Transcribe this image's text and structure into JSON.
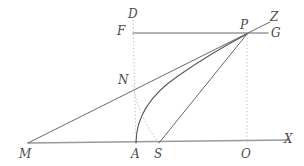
{
  "figure": {
    "width": 304,
    "height": 166,
    "background": "#ffffff",
    "colors": {
      "axis_line": "#9a9a9a",
      "ray_line": "#666666",
      "curve_line": "#555555",
      "dotted_line": "#bdbdbd",
      "label_text": "#4a4a4a"
    }
  },
  "points": [
    {
      "id": "D",
      "label": "D",
      "x": 133,
      "y": 20,
      "label_x": 128,
      "label_y": 8,
      "kind": "endpoint-top-of-vertical"
    },
    {
      "id": "F",
      "label": "F",
      "x": 133,
      "y": 33,
      "label_x": 117,
      "label_y": 25,
      "kind": "left-end-of-upper-horizontal"
    },
    {
      "id": "P",
      "label": "P",
      "x": 247,
      "y": 34,
      "label_x": 240,
      "label_y": 19,
      "kind": "convergence-point"
    },
    {
      "id": "Z",
      "label": "Z",
      "x": 270,
      "y": 22,
      "label_x": 270,
      "label_y": 11,
      "kind": "ray-endpoint"
    },
    {
      "id": "G",
      "label": "G",
      "x": 268,
      "y": 33,
      "label_x": 271,
      "label_y": 27,
      "kind": "right-end-of-upper-horizontal"
    },
    {
      "id": "N",
      "label": "N",
      "x": 133,
      "y": 85,
      "label_x": 118,
      "label_y": 74,
      "kind": "intersection"
    },
    {
      "id": "M",
      "label": "M",
      "x": 28,
      "y": 143,
      "label_x": 19,
      "label_y": 148,
      "kind": "vertex"
    },
    {
      "id": "A",
      "label": "A",
      "x": 136,
      "y": 143,
      "label_x": 131,
      "label_y": 148,
      "kind": "curve-foot"
    },
    {
      "id": "S",
      "label": "S",
      "x": 159,
      "y": 143,
      "label_x": 154,
      "label_y": 148,
      "kind": "curve-foot"
    },
    {
      "id": "O",
      "label": "O",
      "x": 247,
      "y": 143,
      "label_x": 241,
      "label_y": 148,
      "kind": "foot-of-perpendicular"
    },
    {
      "id": "X",
      "label": "X",
      "x": 288,
      "y": 140,
      "label_x": 284,
      "label_y": 133,
      "kind": "axis-endpoint"
    }
  ],
  "segments": [
    {
      "name": "baseline-MX",
      "from": "M",
      "to": "X",
      "style": "solid",
      "stroke": "#9a9a9a",
      "width": 1.6
    },
    {
      "name": "upper-horizontal-FG",
      "from": "F",
      "to": "G",
      "style": "solid",
      "stroke": "#9a9a9a",
      "width": 1.6
    },
    {
      "name": "ray-MZ",
      "from": "M",
      "to": "Z",
      "style": "solid",
      "stroke": "#666666",
      "width": 1.0
    },
    {
      "name": "segment-SP",
      "from": "S",
      "to": "P",
      "style": "solid",
      "stroke": "#666666",
      "width": 1.0
    },
    {
      "name": "vertical-DA",
      "from": "D",
      "to": "A",
      "style": "dotted",
      "stroke": "#bdbdbd",
      "width": 1.0
    },
    {
      "name": "vertical-PO",
      "from": "P",
      "to": "O",
      "style": "dotted",
      "stroke": "#bdbdbd",
      "width": 1.0
    }
  ],
  "curves": [
    {
      "name": "curve-A-to-P",
      "from": "A",
      "to": "P",
      "style": "solid",
      "stroke": "#555555",
      "width": 1.1,
      "path": "M 136 143 C 136 118, 150 95, 178 76 C 205 57, 232 42, 247 34"
    },
    {
      "name": "curve-N-to-S",
      "from": "N",
      "to": "S",
      "style": "dotted",
      "stroke": "#bdbdbd",
      "width": 1.0,
      "path": "M 133 85 C 136 104, 144 124, 159 143"
    }
  ]
}
